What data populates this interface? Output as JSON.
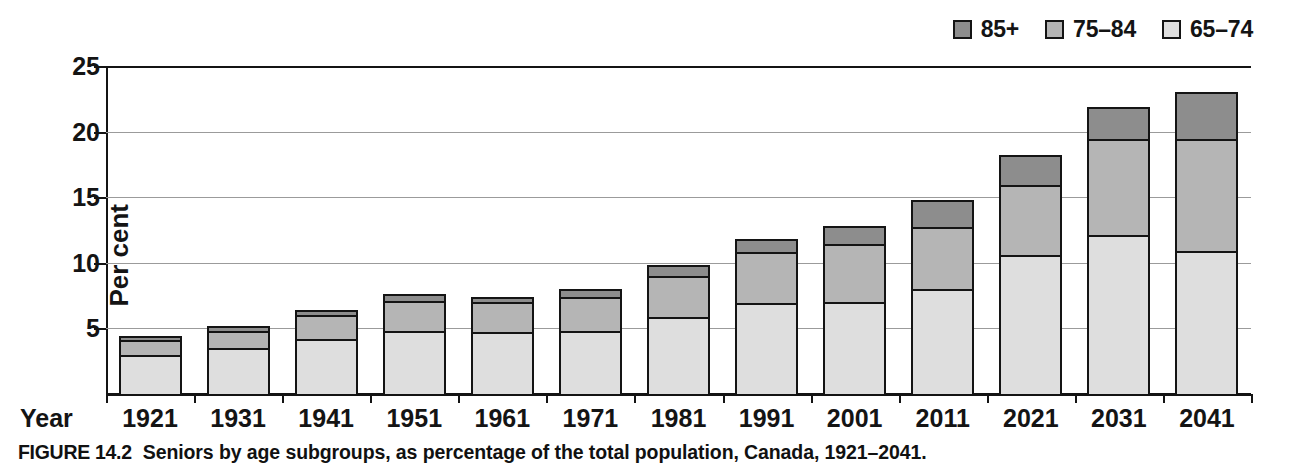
{
  "figure": {
    "caption_number": "FIGURE 14.2",
    "caption_text": "Seniors by age subgroups, as percentage of the total population, Canada, 1921–2041."
  },
  "axes": {
    "x_axis_name": "Year",
    "y_axis_title": "Per cent"
  },
  "legend": {
    "entries": [
      {
        "label": "85+",
        "color": "#8d8d8d"
      },
      {
        "label": "75–84",
        "color": "#b5b5b5"
      },
      {
        "label": "65–74",
        "color": "#dedede"
      }
    ]
  },
  "chart_data": {
    "type": "bar",
    "stacked": true,
    "title": "Seniors by age subgroups, as percentage of the total population, Canada, 1921–2041.",
    "xlabel": "Year",
    "ylabel": "Per cent",
    "ylim": [
      0,
      25
    ],
    "yticks": [
      5,
      10,
      15,
      20,
      25
    ],
    "ytick_labels": [
      "5",
      "10",
      "15",
      "20",
      "25"
    ],
    "grid": true,
    "legend_position": "top-right",
    "categories": [
      "1921",
      "1931",
      "1941",
      "1951",
      "1961",
      "1971",
      "1981",
      "1991",
      "2001",
      "2011",
      "2021",
      "2031",
      "2041"
    ],
    "series": [
      {
        "name": "65–74",
        "color": "#dedede",
        "values": [
          3.0,
          3.5,
          4.2,
          4.8,
          4.7,
          4.8,
          5.9,
          6.9,
          7.0,
          8.0,
          10.6,
          12.1,
          10.9
        ]
      },
      {
        "name": "75–84",
        "color": "#b5b5b5",
        "values": [
          1.1,
          1.3,
          1.8,
          2.3,
          2.3,
          2.6,
          3.1,
          3.9,
          4.4,
          4.7,
          5.3,
          7.3,
          8.5
        ]
      },
      {
        "name": "85+",
        "color": "#8d8d8d",
        "values": [
          0.3,
          0.4,
          0.4,
          0.5,
          0.4,
          0.6,
          0.8,
          1.0,
          1.4,
          2.1,
          2.3,
          2.5,
          3.6
        ]
      }
    ],
    "totals": [
      4.4,
      5.2,
      6.4,
      7.6,
      7.4,
      8.0,
      9.8,
      11.8,
      12.8,
      14.8,
      18.2,
      21.9,
      23.0
    ]
  }
}
